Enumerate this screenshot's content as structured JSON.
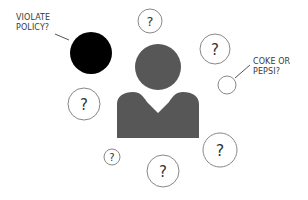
{
  "diagram": {
    "colors": {
      "background": "#ffffff",
      "person": "#575757",
      "black_circle": "#000000",
      "circle_stroke": "#888888",
      "text": "#3a3a3a",
      "connector": "#555555"
    },
    "person": {
      "icon": "person-silhouette-icon",
      "head": {
        "cx": 158,
        "cy": 67,
        "r": 23
      }
    },
    "callouts": [
      {
        "id": "violate-policy",
        "lines": [
          "VIOLATE",
          "POLICY?"
        ],
        "target": "black-circle"
      },
      {
        "id": "coke-or-pepsi",
        "lines": [
          "COKE OR",
          "PEPSI?"
        ],
        "target": "small-empty-circle"
      }
    ],
    "black_circle": {
      "cx": 91,
      "cy": 53,
      "r": 21
    },
    "empty_circle": {
      "cx": 227,
      "cy": 85,
      "r": 9
    },
    "question_circles": [
      {
        "cx": 150,
        "cy": 21,
        "r": 12,
        "label": "?"
      },
      {
        "cx": 215,
        "cy": 49,
        "r": 15,
        "label": "?"
      },
      {
        "cx": 84,
        "cy": 104,
        "r": 16,
        "label": "?"
      },
      {
        "cx": 112,
        "cy": 157,
        "r": 8,
        "label": "?"
      },
      {
        "cx": 163,
        "cy": 171,
        "r": 16,
        "label": "?"
      },
      {
        "cx": 220,
        "cy": 150,
        "r": 17,
        "label": "?"
      }
    ]
  }
}
